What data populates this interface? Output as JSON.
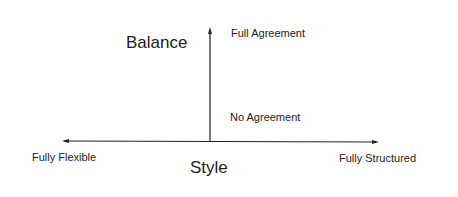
{
  "diagram": {
    "vertical_axis": {
      "title": "Balance",
      "top_label": "Full Agreement",
      "bottom_label": "No Agreement"
    },
    "horizontal_axis": {
      "title": "Style",
      "left_label": "Fully Flexible",
      "right_label": "Fully Structured"
    },
    "colors": {
      "line": "#222222",
      "background": "#ffffff"
    }
  }
}
